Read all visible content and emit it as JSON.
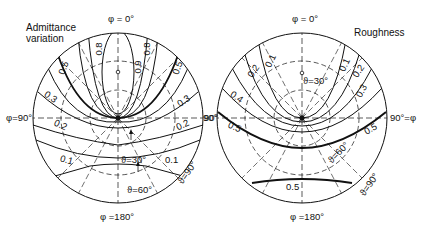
{
  "left_diagram": {
    "title_line1": "Admittance",
    "title_line2": "variation",
    "phi_top": "φ = 0°",
    "phi_bottom": "φ =180°",
    "phi_left": "φ=90°",
    "phi_right": "90°",
    "theta_labels": [
      "ϑ=30°",
      "ϑ=60°",
      "ϑ=90°"
    ],
    "contour_labels": [
      "0.9",
      "0.8",
      "0.8",
      "0.5",
      "0.5",
      "0.3",
      "0.3",
      "0.2",
      "0.2",
      "0.1",
      "0.1"
    ]
  },
  "right_diagram": {
    "title": "Roughness",
    "phi_top": "φ = 0°",
    "phi_bottom": "φ =180°",
    "phi_left": "90°",
    "phi_right": "90°=φ",
    "theta_labels": [
      "ϑ=30°",
      "ϑ=60°",
      "ϑ=90°"
    ],
    "contour_labels": [
      "0.1",
      "0.1",
      "0.2",
      "0.2",
      "0.3",
      "0.4",
      "0.5",
      "0.5",
      "0.5"
    ]
  }
}
